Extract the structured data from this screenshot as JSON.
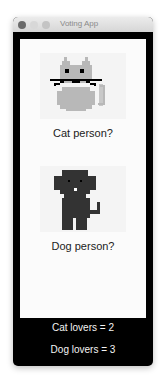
{
  "window": {
    "title": "Voting App",
    "controls": [
      "close",
      "minimize",
      "maximize"
    ]
  },
  "options": [
    {
      "id": "cat",
      "label": "Cat person?",
      "image": "pixel-cat-icon",
      "color": "#b8b8b8"
    },
    {
      "id": "dog",
      "label": "Dog person?",
      "image": "pixel-dog-icon",
      "color": "#333333"
    }
  ],
  "results": {
    "cat_text": "Cat lovers = 2",
    "dog_text": "Dog lovers = 3",
    "cat_count": 2,
    "dog_count": 3
  }
}
